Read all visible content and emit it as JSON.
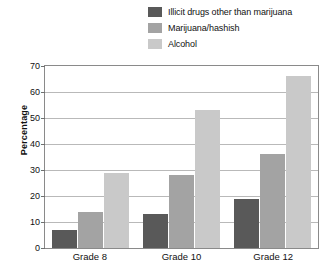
{
  "chart_data": {
    "type": "bar",
    "title": "",
    "xlabel": "",
    "ylabel": "Percentage",
    "ylim": [
      0,
      70
    ],
    "ytick_values": [
      70,
      60,
      50,
      40,
      30,
      20,
      10,
      0
    ],
    "ytick_labels": [
      "70",
      "60",
      "50",
      "40",
      "30",
      "20",
      "10",
      "0"
    ],
    "grid": true,
    "legend_position": "top-right",
    "categories": [
      "Grade 8",
      "Grade 10",
      "Grade 12"
    ],
    "series": [
      {
        "name": "Illicit drugs other than marijuana",
        "color": "#595959",
        "values": [
          7,
          13,
          19
        ]
      },
      {
        "name": "Marijuana/hashish",
        "color": "#a3a3a3",
        "values": [
          14,
          28,
          36
        ]
      },
      {
        "name": "Alcohol",
        "color": "#c9c9c9",
        "values": [
          29,
          53,
          66
        ]
      }
    ]
  },
  "legend": {
    "items": [
      {
        "label": "Illicit drugs other than marijuana",
        "color": "#595959"
      },
      {
        "label": "Marijuana/hashish",
        "color": "#a3a3a3"
      },
      {
        "label": "Alcohol",
        "color": "#c9c9c9"
      }
    ]
  },
  "axes": {
    "y_title": "Percentage",
    "y_ticks": [
      "70",
      "60",
      "50",
      "40",
      "30",
      "20",
      "10",
      "0"
    ],
    "x_labels": [
      "Grade 8",
      "Grade 10",
      "Grade 12"
    ]
  }
}
